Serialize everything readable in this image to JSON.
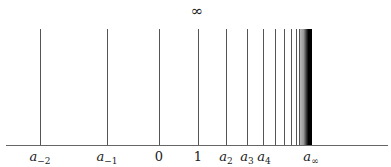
{
  "diagram": {
    "title_symbol": "∞",
    "lines_x": [
      40,
      107,
      159,
      198,
      226,
      247,
      263,
      275,
      284,
      291,
      296,
      299
    ],
    "dense_region": {
      "start_x": 300,
      "end_x": 312
    },
    "labels": [
      {
        "id": "a-2",
        "base": "a",
        "sub": "−2",
        "x": 40
      },
      {
        "id": "a-1",
        "base": "a",
        "sub": "−1",
        "x": 107
      },
      {
        "id": "zero",
        "base": "0",
        "sub": "",
        "x": 159
      },
      {
        "id": "one",
        "base": "1",
        "sub": "",
        "x": 198
      },
      {
        "id": "a2",
        "base": "a",
        "sub": "2",
        "x": 226
      },
      {
        "id": "a3",
        "base": "a",
        "sub": "3",
        "x": 247
      },
      {
        "id": "a4",
        "base": "a",
        "sub": "4",
        "x": 264
      },
      {
        "id": "ainf",
        "base": "a",
        "sub": "∞",
        "x": 311
      }
    ]
  }
}
